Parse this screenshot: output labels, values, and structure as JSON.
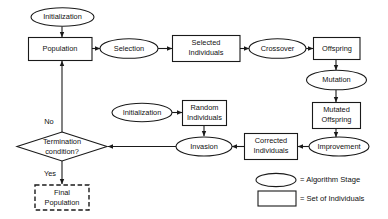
{
  "diagram": {
    "colors": {
      "stroke": "#1a1a1a",
      "fill": "#ffffff",
      "text": "#111111"
    },
    "nodes": {
      "initialization_top": {
        "label": "Initialization",
        "shape": "ellipse"
      },
      "population": {
        "label": "Population",
        "shape": "rect"
      },
      "selection": {
        "label": "Selection",
        "shape": "ellipse"
      },
      "selected_individuals_line1": {
        "label": "Selected",
        "shape": "rect"
      },
      "selected_individuals_line2": {
        "label": "Individuals",
        "shape": "rect"
      },
      "crossover": {
        "label": "Crossover",
        "shape": "ellipse"
      },
      "offspring": {
        "label": "Offspring",
        "shape": "rect"
      },
      "mutation": {
        "label": "Mutation",
        "shape": "ellipse"
      },
      "mutated_offspring_line1": {
        "label": "Mutated",
        "shape": "rect"
      },
      "mutated_offspring_line2": {
        "label": "Offspring",
        "shape": "rect"
      },
      "improvement": {
        "label": "Improvement",
        "shape": "ellipse"
      },
      "corrected_individuals_line1": {
        "label": "Corrected",
        "shape": "rect"
      },
      "corrected_individuals_line2": {
        "label": "Individuals",
        "shape": "rect"
      },
      "invasion": {
        "label": "Invasion",
        "shape": "ellipse"
      },
      "random_individuals_line1": {
        "label": "Random",
        "shape": "rect"
      },
      "random_individuals_line2": {
        "label": "Individuals",
        "shape": "rect"
      },
      "initialization_mid": {
        "label": "Initialization",
        "shape": "ellipse"
      },
      "termination_line1": {
        "label": "Termination",
        "shape": "diamond"
      },
      "termination_line2": {
        "label": "condition?",
        "shape": "diamond"
      },
      "final_population_line1": {
        "label": "Final",
        "shape": "rect-dashed"
      },
      "final_population_line2": {
        "label": "Population",
        "shape": "rect-dashed"
      }
    },
    "edge_labels": {
      "no": "No",
      "yes": "Yes"
    },
    "legend": {
      "ellipse_meaning": "= Algorithm Stage",
      "rect_meaning": "= Set of Individuals"
    }
  }
}
